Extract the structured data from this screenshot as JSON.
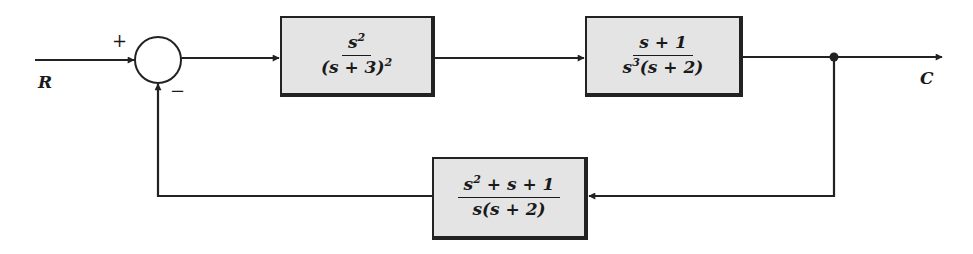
{
  "diagram": {
    "type": "feedback-control-block-diagram",
    "input_label": "R",
    "output_label": "C",
    "summing_junction": {
      "plus_sign": "+",
      "minus_sign": "−"
    },
    "forward_blocks": [
      {
        "id": "G1",
        "numerator": "s",
        "numerator_exp": "2",
        "denominator": "(s + 3)",
        "denominator_exp": "2",
        "text": "s^2 / (s + 3)^2"
      },
      {
        "id": "G2",
        "numerator": "s + 1",
        "denominator_pre": "s",
        "denominator_exp": "3",
        "denominator_post": "(s + 2)",
        "text": "(s + 1) / (s^3 (s + 2))"
      }
    ],
    "feedback_block": {
      "id": "H",
      "numerator_pre": "s",
      "numerator_exp": "2",
      "numerator_post": " + s + 1",
      "denominator": "s(s + 2)",
      "text": "(s^2 + s + 1) / (s(s + 2))"
    },
    "colors": {
      "line": "#222222",
      "block_fill": "#e4e4e4",
      "background": "#ffffff"
    }
  }
}
